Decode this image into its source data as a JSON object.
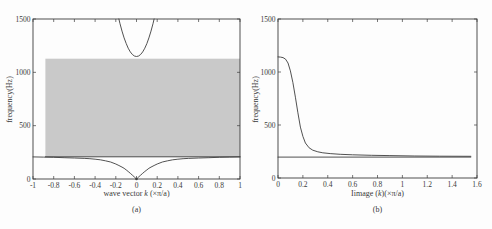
{
  "figure": {
    "background": "#fdfdfd",
    "line_color": "#3d3d3d",
    "text_color": "#3a3a3a",
    "band_color": "#c9c9c9"
  },
  "chart_data": [
    {
      "id": "a",
      "type": "line",
      "caption": "(a)",
      "xlabel": {
        "pre": "wave vector ",
        "var": "k",
        "post": " (×π/a)"
      },
      "ylabel": "frequency(Hz)",
      "xlim": [
        -1,
        1
      ],
      "ylim": [
        0,
        1500
      ],
      "xticks": [
        -1,
        -0.8,
        -0.6,
        -0.4,
        -0.2,
        0,
        0.2,
        0.4,
        0.6,
        0.8,
        1
      ],
      "xtick_labels": [
        "-1",
        "-0.8",
        "-0.6",
        "-0.4",
        "-0.2",
        "0",
        "0.2",
        "0.4",
        "0.6",
        "0.8",
        "1"
      ],
      "yticks": [
        0,
        500,
        1000,
        1500
      ],
      "ytick_labels": [
        "0",
        "500",
        "1000",
        "1500"
      ],
      "grid": false,
      "band": {
        "x0": -0.88,
        "x1": 1,
        "y0": 208,
        "y1": 1128,
        "meaning": "shaded pass band"
      },
      "series": [
        {
          "name": "upper-optical-branch",
          "points": [
            [
              -0.17,
              1500
            ],
            [
              -0.16,
              1460
            ],
            [
              -0.14,
              1387
            ],
            [
              -0.12,
              1323
            ],
            [
              -0.1,
              1270
            ],
            [
              -0.08,
              1226
            ],
            [
              -0.06,
              1192
            ],
            [
              -0.04,
              1167
            ],
            [
              -0.02,
              1153
            ],
            [
              0,
              1148
            ],
            [
              0.02,
              1153
            ],
            [
              0.04,
              1167
            ],
            [
              0.06,
              1192
            ],
            [
              0.08,
              1226
            ],
            [
              0.1,
              1270
            ],
            [
              0.12,
              1323
            ],
            [
              0.14,
              1387
            ],
            [
              0.16,
              1460
            ],
            [
              0.17,
              1500
            ]
          ]
        },
        {
          "name": "lower-band-edge-line",
          "points": [
            [
              -0.88,
              208
            ],
            [
              1,
              208
            ]
          ]
        },
        {
          "name": "lower-acoustic-branch",
          "points": [
            [
              -1,
              207
            ],
            [
              -0.9,
              205
            ],
            [
              -0.8,
              203
            ],
            [
              -0.7,
              200
            ],
            [
              -0.6,
              197
            ],
            [
              -0.5,
              193
            ],
            [
              -0.45,
              190
            ],
            [
              -0.4,
              186
            ],
            [
              -0.35,
              180
            ],
            [
              -0.3,
              171
            ],
            [
              -0.25,
              159
            ],
            [
              -0.2,
              141
            ],
            [
              -0.17,
              127
            ],
            [
              -0.14,
              112
            ],
            [
              -0.12,
              100
            ],
            [
              -0.1,
              85
            ],
            [
              -0.08,
              70
            ],
            [
              -0.06,
              53
            ],
            [
              -0.04,
              36
            ],
            [
              -0.02,
              19
            ],
            [
              -0.01,
              10
            ],
            [
              0,
              0
            ],
            [
              0.01,
              10
            ],
            [
              0.02,
              19
            ],
            [
              0.04,
              36
            ],
            [
              0.06,
              53
            ],
            [
              0.08,
              70
            ],
            [
              0.1,
              85
            ],
            [
              0.12,
              100
            ],
            [
              0.14,
              112
            ],
            [
              0.17,
              127
            ],
            [
              0.2,
              141
            ],
            [
              0.25,
              159
            ],
            [
              0.3,
              171
            ],
            [
              0.35,
              180
            ],
            [
              0.4,
              186
            ],
            [
              0.45,
              190
            ],
            [
              0.5,
              193
            ],
            [
              0.6,
              197
            ],
            [
              0.7,
              200
            ],
            [
              0.8,
              203
            ],
            [
              0.9,
              205
            ],
            [
              1,
              207
            ]
          ]
        }
      ],
      "markers": [
        {
          "x": 0,
          "y": 0,
          "r": 1.3
        }
      ]
    },
    {
      "id": "b",
      "type": "line",
      "caption": "(b)",
      "xlabel": {
        "pre": "Iimage (",
        "var": "k",
        "post": ")(×π/a)"
      },
      "ylabel": "frequency(Hz)",
      "xlim": [
        0,
        1.6
      ],
      "ylim": [
        0,
        1500
      ],
      "xticks": [
        0,
        0.2,
        0.4,
        0.6,
        0.8,
        1,
        1.2,
        1.4,
        1.6
      ],
      "xtick_labels": [
        "0",
        "0.2",
        "0.4",
        "0.6",
        "0.8",
        "1",
        "1.2",
        "1.4",
        "1.6"
      ],
      "yticks": [
        0,
        500,
        1000,
        1500
      ],
      "ytick_labels": [
        "0",
        "500",
        "1000",
        "1500"
      ],
      "grid": false,
      "series": [
        {
          "name": "evanescent-decay-curve",
          "points": [
            [
              0,
              1142
            ],
            [
              0.02,
              1141
            ],
            [
              0.04,
              1136
            ],
            [
              0.06,
              1122
            ],
            [
              0.08,
              1085
            ],
            [
              0.1,
              1010
            ],
            [
              0.12,
              900
            ],
            [
              0.14,
              762
            ],
            [
              0.16,
              615
            ],
            [
              0.18,
              480
            ],
            [
              0.2,
              392
            ],
            [
              0.22,
              330
            ],
            [
              0.25,
              285
            ],
            [
              0.28,
              262
            ],
            [
              0.32,
              247
            ],
            [
              0.36,
              238
            ],
            [
              0.42,
              230
            ],
            [
              0.5,
              224
            ],
            [
              0.6,
              219
            ],
            [
              0.75,
              214
            ],
            [
              0.9,
              211
            ],
            [
              1.1,
              208
            ],
            [
              1.3,
              206
            ],
            [
              1.55,
              205
            ]
          ]
        },
        {
          "name": "flat-band-line",
          "points": [
            [
              0,
              197
            ],
            [
              1.55,
              197
            ]
          ]
        }
      ],
      "markers": []
    }
  ]
}
